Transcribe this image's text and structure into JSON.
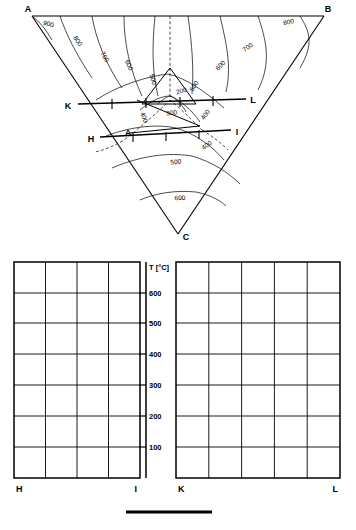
{
  "figure": {
    "type": "ternary-liquidus-with-sections",
    "corners": [
      {
        "id": "A",
        "label": "A",
        "x": 32,
        "y": 16
      },
      {
        "id": "B",
        "label": "B",
        "x": 324,
        "y": 16
      },
      {
        "id": "C",
        "label": "C",
        "x": 178,
        "y": 234
      }
    ],
    "inner_points": [
      {
        "id": "K",
        "label": "K",
        "x": 74,
        "y": 104
      },
      {
        "id": "L",
        "label": "L",
        "x": 248,
        "y": 99
      },
      {
        "id": "H",
        "label": "H",
        "x": 97,
        "y": 137
      },
      {
        "id": "I",
        "label": "I",
        "x": 232,
        "y": 131
      },
      {
        "id": "A2",
        "label": "A",
        "x": 129,
        "y": 133
      },
      {
        "id": "E",
        "label": "e",
        "x": 170,
        "y": 100
      }
    ],
    "contour_labels": [
      {
        "value": "900",
        "x": 48,
        "y": 24
      },
      {
        "value": "800",
        "x": 76,
        "y": 40
      },
      {
        "value": "700",
        "x": 103,
        "y": 56
      },
      {
        "value": "600",
        "x": 127,
        "y": 64
      },
      {
        "value": "500",
        "x": 150,
        "y": 79
      },
      {
        "value": "200",
        "x": 180,
        "y": 93
      },
      {
        "value": "300",
        "x": 172,
        "y": 113
      },
      {
        "value": "400",
        "x": 143,
        "y": 117
      },
      {
        "value": "400",
        "x": 205,
        "y": 115
      },
      {
        "value": "500",
        "x": 194,
        "y": 86
      },
      {
        "value": "600",
        "x": 221,
        "y": 65
      },
      {
        "value": "700",
        "x": 248,
        "y": 47
      },
      {
        "value": "800",
        "x": 287,
        "y": 22
      },
      {
        "value": "400",
        "x": 206,
        "y": 145
      },
      {
        "value": "500",
        "x": 175,
        "y": 162
      },
      {
        "value": "600",
        "x": 178,
        "y": 198
      }
    ],
    "isotherm_values": [
      900,
      800,
      700,
      600,
      500,
      400,
      300,
      200
    ]
  },
  "sections": {
    "axis": {
      "title": "T [°C]",
      "ticks": [
        "600",
        "500",
        "400",
        "300",
        "200",
        "100"
      ],
      "tick_values": [
        600,
        500,
        400,
        300,
        200,
        100
      ],
      "min": 0,
      "max": 700
    },
    "left_panel": {
      "left_label": "H",
      "right_label": "I",
      "columns": 4,
      "rows": 7
    },
    "right_panel": {
      "left_label": "K",
      "right_label": "L",
      "columns": 5,
      "rows": 7
    }
  },
  "scalebar": {
    "present": true
  }
}
